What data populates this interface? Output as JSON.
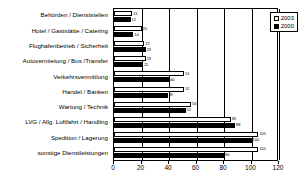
{
  "chart_data": {
    "type": "bar",
    "orientation": "horizontal",
    "title": "",
    "xlabel": "",
    "ylabel": "",
    "xlim": [
      0,
      120
    ],
    "xticks": [
      0,
      20,
      40,
      60,
      80,
      100,
      120
    ],
    "grid": true,
    "legend_position": "top-right",
    "categories": [
      "Behörden / Dienststellen",
      "Hotel / Gaststätte / Catering",
      "Flughafenbetrieb / Sicherheit",
      "Autovermietung / Bus /Transfer",
      "Verkehrsvermittlung",
      "Handel / Banken",
      "Wartung / Technik",
      "LVG / Allg. Luftfahrt / Handling",
      "Spedition / Lagerung",
      "sonstige Dienstleistungen"
    ],
    "series": [
      {
        "name": "2003",
        "color": "#ffffff",
        "values": [
          13,
          20,
          22,
          23,
          51,
          51,
          56,
          85,
          105,
          105
        ]
      },
      {
        "name": "2000",
        "color": "#000000",
        "values": [
          12,
          14,
          23,
          21,
          40,
          39,
          52,
          88,
          100,
          80
        ]
      }
    ]
  },
  "legend": {
    "items": [
      {
        "label": "2003",
        "swatch": "white-square-icon"
      },
      {
        "label": "2000",
        "swatch": "black-square-icon"
      }
    ]
  }
}
